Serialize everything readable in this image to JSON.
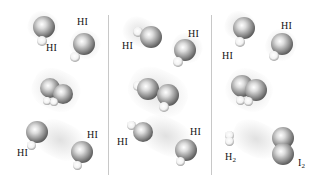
{
  "figure": {
    "panels": [
      {
        "id": "p1",
        "labels": [
          {
            "text": "HI",
            "x": 45,
            "y": 43
          },
          {
            "text": "HI",
            "x": 77,
            "y": 16
          }
        ]
      },
      {
        "id": "p2",
        "labels": [
          {
            "text": "HI",
            "x": 122,
            "y": 40
          },
          {
            "text": "HI",
            "x": 188,
            "y": 28
          }
        ]
      },
      {
        "id": "p3",
        "labels": [
          {
            "text": "HI",
            "x": 222,
            "y": 50
          },
          {
            "text": "HI",
            "x": 281,
            "y": 20
          }
        ]
      },
      {
        "id": "p4",
        "labels": []
      },
      {
        "id": "p5",
        "labels": []
      },
      {
        "id": "p6",
        "labels": []
      },
      {
        "id": "p7",
        "labels": [
          {
            "text": "HI",
            "x": 17,
            "y": 148
          },
          {
            "text": "HI",
            "x": 87,
            "y": 129
          }
        ]
      },
      {
        "id": "p8",
        "labels": [
          {
            "text": "HI",
            "x": 117,
            "y": 136
          },
          {
            "text": "HI",
            "x": 190,
            "y": 126
          }
        ]
      },
      {
        "id": "p9",
        "labels": [
          {
            "text": "H",
            "sub": "2",
            "x": 225,
            "y": 151
          },
          {
            "text": "I",
            "sub": "2",
            "x": 298,
            "y": 158
          }
        ]
      }
    ],
    "labels": {
      "hi": "HI",
      "h2": "H",
      "h2_sub": "2",
      "i2": "I",
      "i2_sub": "2"
    },
    "colors": {
      "background": "#ffffff",
      "divider": "#c8c8c8",
      "text": "#111111"
    }
  }
}
